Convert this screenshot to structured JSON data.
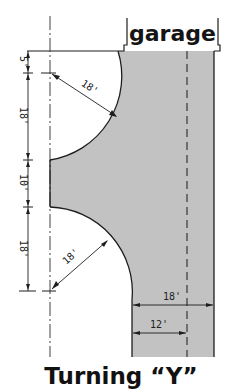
{
  "diagram": {
    "title": "Turning “Y”",
    "garage_label": "garage",
    "colors": {
      "pavement": "#c2c2c2",
      "line": "#1e1e1e",
      "background": "#ffffff"
    },
    "vertical_dimensions": [
      {
        "label": "5'",
        "from_y": 51,
        "to_y": 73
      },
      {
        "label": "18'",
        "from_y": 73,
        "to_y": 160
      },
      {
        "label": "10'",
        "from_y": 160,
        "to_y": 207
      },
      {
        "label": "18'",
        "from_y": 207,
        "to_y": 291
      }
    ],
    "radii": [
      {
        "label": "18'",
        "position": "upper"
      },
      {
        "label": "18'",
        "position": "lower"
      }
    ],
    "horizontal_dimensions": [
      {
        "label": "18'",
        "description": "driveway width"
      },
      {
        "label": "12'",
        "description": "lane width to centerline"
      }
    ]
  }
}
